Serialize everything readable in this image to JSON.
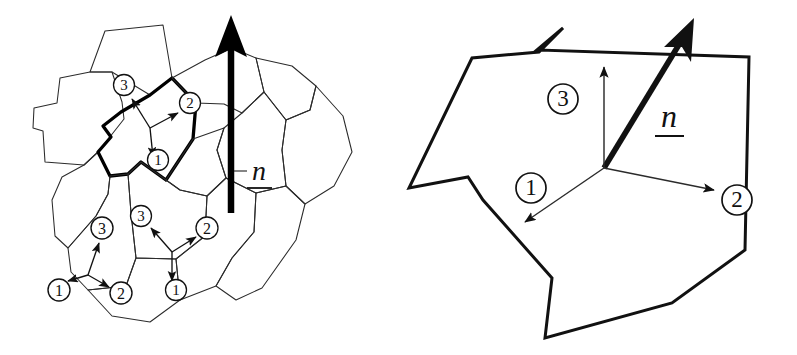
{
  "figure": {
    "background_color": "#ffffff",
    "line_color": "#1a1a1a",
    "bold_line_color": "#000000",
    "thin_line_color": "#3a3a3a",
    "width": 797,
    "height": 355,
    "panel_count": 2
  },
  "panels": [
    {
      "id": "left",
      "name": "polycrystal-aggregate-panel",
      "description": "Polycrystalline aggregate of grains drawn as thin-line polygons, one grain highlighted with a bold outline, three local coordinate triads, and one large bold normal arrow.",
      "normal_label": "n",
      "normal_arrow": {
        "name": "normal-arrow",
        "direction": "up",
        "style": "bold-filled"
      },
      "highlighted_grain": {
        "name": "highlighted-grain",
        "stroke_weight": "bold"
      },
      "triads": [
        {
          "name": "triad-highlighted-grain",
          "axes": [
            {
              "label": "1",
              "marker": "circled-number-1"
            },
            {
              "label": "2",
              "marker": "circled-number-2"
            },
            {
              "label": "3",
              "marker": "circled-number-3"
            }
          ]
        },
        {
          "name": "triad-lower-left-grain",
          "axes": [
            {
              "label": "1",
              "marker": "circled-number-1"
            },
            {
              "label": "2",
              "marker": "circled-number-2"
            },
            {
              "label": "3",
              "marker": "circled-number-3"
            }
          ]
        },
        {
          "name": "triad-lower-middle-grain",
          "axes": [
            {
              "label": "1",
              "marker": "circled-number-1"
            },
            {
              "label": "2",
              "marker": "circled-number-2"
            },
            {
              "label": "3",
              "marker": "circled-number-3"
            }
          ]
        }
      ]
    },
    {
      "id": "right",
      "name": "single-grain-facet-panel",
      "description": "Enlarged view of a single grain facet drawn as a bold non-convex polygon with a local orthonormal triad and the bold grain normal arrow.",
      "normal_label": "n",
      "normal_arrow": {
        "name": "normal-arrow",
        "direction": "up-right",
        "style": "bold-filled"
      },
      "triad": {
        "name": "triad-single-grain",
        "axes": [
          {
            "label": "1",
            "marker": "circled-number-1",
            "direction": "down-left"
          },
          {
            "label": "2",
            "marker": "circled-number-2",
            "direction": "right"
          },
          {
            "label": "3",
            "marker": "circled-number-3",
            "direction": "up"
          }
        ]
      }
    }
  ],
  "labels": {
    "normal_left": "n",
    "normal_right": "n",
    "axis_1": "1",
    "axis_2": "2",
    "axis_3": "3"
  }
}
